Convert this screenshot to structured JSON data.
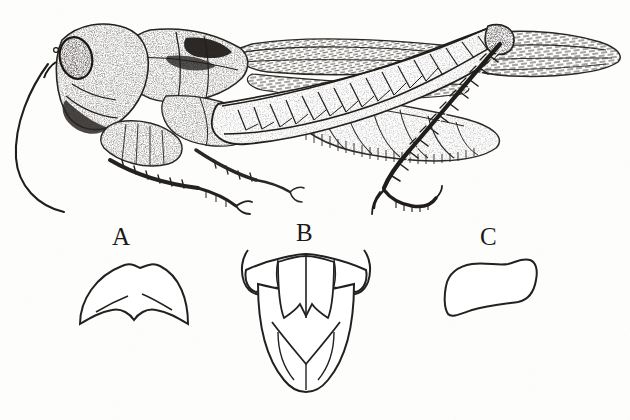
{
  "plate": {
    "title": "Grasshopper lateral habitus with structural details",
    "medium": "stipple-and-line engraving",
    "background_color": "#fdfdfc",
    "ink_color": "#1c1a18",
    "width": 630,
    "height": 420
  },
  "main_figure": {
    "name": "grasshopper-lateral-view",
    "orientation": "facing left, lateral (side) view",
    "parts": [
      {
        "name": "antenna",
        "note": "long filiform antenna curving down and back below the head"
      },
      {
        "name": "head",
        "note": "large compound eye, stippled gena and frons"
      },
      {
        "name": "pronotum",
        "note": "saddle-shaped, densely stippled with dark lateral lobe"
      },
      {
        "name": "tegmen",
        "note": "forewing with dense cross-venation extending past abdomen to right edge"
      },
      {
        "name": "hind-wing",
        "note": "folded beneath the tegmen"
      },
      {
        "name": "abdomen",
        "note": "segmented, stippled, with hind femur crossing it"
      },
      {
        "name": "hind-femur",
        "note": "enlarged jumping femur with chevron herringbone striations"
      },
      {
        "name": "hind-tibia",
        "note": "slender, armed with a double row of spines"
      },
      {
        "name": "hind-tarsus",
        "note": "three-segmented with terminal claws"
      },
      {
        "name": "fore-leg",
        "note": "femur, spined tibia and tarsus"
      },
      {
        "name": "mid-leg",
        "note": "partly hidden behind the fore-leg"
      }
    ]
  },
  "detail_figures": [
    {
      "id": "A",
      "label": "A",
      "name": "pronotum-dorsal-outline",
      "description": "dome-shaped outline with a notched, concave base and two short internal diagonal lines at the lower corners"
    },
    {
      "id": "B",
      "label": "B",
      "name": "terminal-abdominal-segments",
      "description": "ventral view: transverse bar with upcurved cerci at top, median plate with paired lobes, tapering shield-shaped subgenital plate with a V-shaped internal crease"
    },
    {
      "id": "C",
      "label": "C",
      "name": "cercus-lateral-outline",
      "description": "curved boot-shaped outline, broad at the lower left, narrowing then flaring to a rounded upper right apex"
    }
  ]
}
